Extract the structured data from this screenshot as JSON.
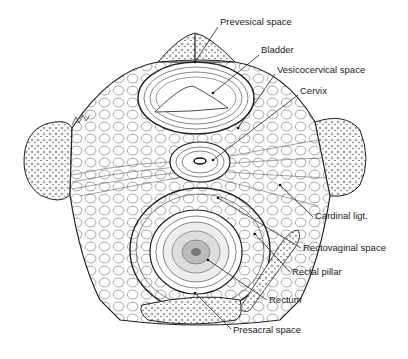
{
  "figure": {
    "signature": "sign.",
    "line_color": "#222222",
    "background": "#ffffff"
  },
  "labels": [
    {
      "id": "prevesical",
      "text": "Prevesical space",
      "x": 220,
      "y": 22,
      "pointer": [
        195,
        62
      ]
    },
    {
      "id": "bladder",
      "text": "Bladder",
      "x": 261,
      "y": 50,
      "pointer": [
        213,
        93
      ]
    },
    {
      "id": "vesicocervical",
      "text": "Vesicocervical space",
      "x": 277,
      "y": 69,
      "pointer": [
        238,
        128
      ]
    },
    {
      "id": "cervix",
      "text": "Cervix",
      "x": 300,
      "y": 90,
      "pointer": [
        213,
        160
      ]
    },
    {
      "id": "cardinal",
      "text": "Cardinal ligt.",
      "x": 315,
      "y": 215,
      "pointer": [
        280,
        185
      ]
    },
    {
      "id": "rectovaginal",
      "text": "Rectovaginal space",
      "x": 303,
      "y": 246,
      "pointer": [
        218,
        198
      ]
    },
    {
      "id": "rectal_pillar",
      "text": "Rectal pillar",
      "x": 292,
      "y": 270,
      "pointer": [
        255,
        234
      ]
    },
    {
      "id": "rectum",
      "text": "Rectum",
      "x": 269,
      "y": 298,
      "pointer": [
        208,
        260
      ]
    },
    {
      "id": "presacral",
      "text": "Presacral space",
      "x": 233,
      "y": 327,
      "pointer": [
        195,
        293
      ]
    }
  ]
}
